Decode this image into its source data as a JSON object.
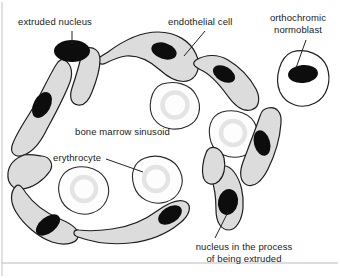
{
  "figure": {
    "domain_note": "histology schematic of erythrocyte enucleation at a bone marrow sinusoid",
    "background_color": "#ffffff",
    "frame_color": "#b9b9b9"
  },
  "palette": {
    "endothelium_fill": "#dcdcdc",
    "endothelium_stroke": "#1f1f1f",
    "nucleus_fill": "#0d0d0d",
    "erythrocyte_fill": "#fdfdfd",
    "erythrocyte_stroke": "#2a2a2a",
    "erythrocyte_pallor": "#e8e8e8",
    "normoblast_fill": "#ffffff",
    "leader_line": "#222222",
    "text_color": "#1a1a1a",
    "rule_color": "#bbbbbb"
  },
  "labels": [
    {
      "id": "extruded-nucleus",
      "text": "extruded nucleus",
      "x": 18,
      "y": 16,
      "lines": 1,
      "leader": true
    },
    {
      "id": "endothelial-cell",
      "text": "endothelial cell",
      "x": 168,
      "y": 16,
      "lines": 1,
      "leader": true
    },
    {
      "id": "orthochromic-normoblast",
      "text_line1": "orthochromic",
      "text_line2": "normoblast",
      "x": 262,
      "y": 12,
      "lines": 2,
      "leader": true
    },
    {
      "id": "bone-marrow-sinusoid",
      "text": "bone marrow sinusoid",
      "x": 75,
      "y": 126,
      "lines": 1,
      "leader": false
    },
    {
      "id": "erythrocyte",
      "text": "erythrocyte",
      "x": 53,
      "y": 152,
      "lines": 1,
      "leader": true
    },
    {
      "id": "nucleus-being-extruded",
      "text_line1": "nucleus in the process",
      "text_line2": "of being extruded",
      "x": 184,
      "y": 241,
      "lines": 2,
      "leader": true
    }
  ],
  "structures": {
    "endothelial_cells": [
      {
        "id": "endothelial-cell-upper-left",
        "nucleus": true
      },
      {
        "id": "endothelial-cell-left-upper-lobe",
        "nucleus": false
      },
      {
        "id": "endothelial-cell-top-center",
        "nucleus": true
      },
      {
        "id": "endothelial-cell-top-right",
        "nucleus": true
      },
      {
        "id": "endothelial-cell-right",
        "nucleus": true
      },
      {
        "id": "endothelial-cell-bottom-left",
        "nucleus": true
      },
      {
        "id": "endothelial-cell-bottom-center",
        "nucleus": true
      },
      {
        "id": "endothelial-cell-bottom-right",
        "nucleus": true
      }
    ],
    "erythrocytes": [
      {
        "id": "erythrocyte-upper-center"
      },
      {
        "id": "erythrocyte-center-right"
      },
      {
        "id": "erythrocyte-lower-left"
      },
      {
        "id": "erythrocyte-lower-center"
      }
    ],
    "normoblast": {
      "id": "orthochromic-normoblast-cell",
      "nucleus": true
    },
    "free_nucleus": {
      "id": "extruded-nucleus-body"
    },
    "extruding_nucleus": {
      "id": "nucleus-being-extruded-body"
    }
  }
}
